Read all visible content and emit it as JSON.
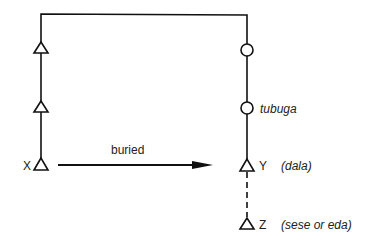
{
  "diagram": {
    "type": "kinship",
    "labels": {
      "x": "X",
      "buried": "buried",
      "tubuga": "tubuga",
      "y": "Y",
      "dala": "(dala)",
      "z": "Z",
      "sese": "(sese or eda)"
    },
    "nodes": [
      {
        "id": "left-top",
        "shape": "triangle",
        "gender": "male"
      },
      {
        "id": "left-mid",
        "shape": "triangle",
        "gender": "male"
      },
      {
        "id": "X",
        "shape": "triangle",
        "gender": "male"
      },
      {
        "id": "right-top",
        "shape": "circle",
        "gender": "female"
      },
      {
        "id": "tubuga",
        "shape": "circle",
        "gender": "female"
      },
      {
        "id": "Y",
        "shape": "triangle",
        "gender": "male"
      },
      {
        "id": "Z",
        "shape": "triangle",
        "gender": "male"
      }
    ],
    "edges": [
      {
        "from": "X",
        "to": "Y",
        "label": "buried",
        "style": "arrow"
      },
      {
        "from": "Y",
        "to": "Z",
        "style": "dashed"
      }
    ]
  }
}
